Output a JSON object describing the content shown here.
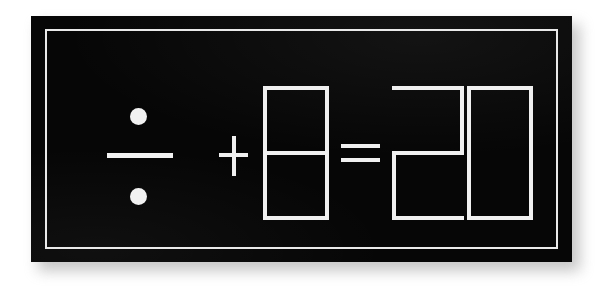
{
  "scene": {
    "kind": "photo-of-sign",
    "background_color": "#ffffff"
  },
  "plaque": {
    "background_color": "#060606",
    "border_color": "#e9e9e9",
    "has_drop_shadow": true
  },
  "equation": {
    "text": "÷ + 8 = 20",
    "stroke_color": "#f0f0f0",
    "style": "outlined-segment-display",
    "terms": [
      {
        "id": "divide-operator",
        "symbol": "÷",
        "name": "division-sign",
        "reading": "divided by"
      },
      {
        "id": "plus-operator",
        "symbol": "+",
        "name": "plus-sign",
        "reading": "plus"
      },
      {
        "id": "operand-eight",
        "symbol": "8",
        "name": "digit-eight",
        "reading": "eight"
      },
      {
        "id": "equals-operator",
        "symbol": "=",
        "name": "equals-sign",
        "reading": "equals"
      },
      {
        "id": "result-two",
        "symbol": "2",
        "name": "digit-two",
        "reading": "two"
      },
      {
        "id": "result-zero",
        "symbol": "0",
        "name": "digit-zero",
        "reading": "zero"
      }
    ],
    "result": "20"
  }
}
